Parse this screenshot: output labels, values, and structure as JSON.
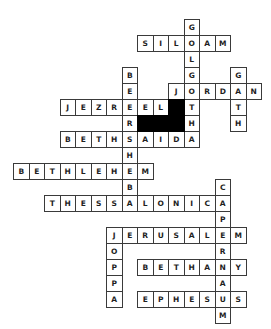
{
  "puzzle": {
    "type": "crossword",
    "grid": {
      "origin_x": 13,
      "origin_y": 19,
      "col_step": 15.5,
      "row_step": 16,
      "cell_w": 16.5,
      "cell_h": 17
    },
    "colors": {
      "border": "#3a3a3a",
      "text": "#1e1e1e",
      "block": "#000000",
      "background": "#ffffff"
    },
    "words": [
      {
        "word": "GOLGOTHA",
        "dir": "down",
        "row": 0,
        "col": 11
      },
      {
        "word": "SILOAM",
        "dir": "across",
        "row": 1,
        "col": 8
      },
      {
        "word": "JORDAN",
        "dir": "across",
        "row": 4,
        "col": 10
      },
      {
        "word": "GATH",
        "dir": "down",
        "row": 3,
        "col": 14
      },
      {
        "word": "BEERSHEBA",
        "dir": "down",
        "row": 3,
        "col": 7
      },
      {
        "word": "JEZREEL",
        "dir": "across",
        "row": 5,
        "col": 3
      },
      {
        "word": "BETHSAIDA",
        "dir": "across",
        "row": 7,
        "col": 3
      },
      {
        "word": "BETHLEHEM",
        "dir": "across",
        "row": 9,
        "col": 0
      },
      {
        "word": "THESSALONICA",
        "dir": "across",
        "row": 11,
        "col": 2
      },
      {
        "word": "CAPERNAUM",
        "dir": "down",
        "row": 10,
        "col": 13
      },
      {
        "word": "JERUSALEM",
        "dir": "across",
        "row": 13,
        "col": 6
      },
      {
        "word": "JOPPA",
        "dir": "down",
        "row": 13,
        "col": 6
      },
      {
        "word": "BETHANY",
        "dir": "across",
        "row": 15,
        "col": 8
      },
      {
        "word": "EPHESUS",
        "dir": "across",
        "row": 17,
        "col": 8
      }
    ],
    "blocks": [
      {
        "row": 5,
        "col": 10
      },
      {
        "row": 6,
        "col": 8
      },
      {
        "row": 6,
        "col": 9
      },
      {
        "row": 6,
        "col": 10
      }
    ]
  }
}
